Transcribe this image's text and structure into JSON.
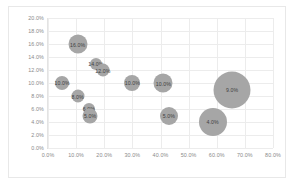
{
  "chart_data": {
    "type": "scatter",
    "title": "",
    "xlabel": "",
    "ylabel": "",
    "xlim": [
      0,
      80
    ],
    "ylim": [
      0,
      20
    ],
    "grid": true,
    "legend": false,
    "legend_position": "none",
    "xticks": [
      "0.0%",
      "10.0%",
      "20.0%",
      "30.0%",
      "40.0%",
      "50.0%",
      "60.0%",
      "70.0%",
      "80.0%"
    ],
    "xtick_values": [
      0,
      10,
      20,
      30,
      40,
      50,
      60,
      70,
      80
    ],
    "yticks": [
      "0.0%",
      "2.0%",
      "4.0%",
      "6.0%",
      "8.0%",
      "10.0%",
      "12.0%",
      "14.0%",
      "16.0%",
      "18.0%",
      "20.0%"
    ],
    "ytick_values": [
      0,
      2,
      4,
      6,
      8,
      10,
      12,
      14,
      16,
      18,
      20
    ],
    "bubble_color": "#a6a6a6",
    "points": [
      {
        "label": "16.0%",
        "x": 10.5,
        "y": 16.0,
        "size": 9.5,
        "label_pos": "center"
      },
      {
        "label": "14.0%",
        "x": 17.0,
        "y": 13.0,
        "size": 6.0,
        "label_pos": "center"
      },
      {
        "label": "12.0%",
        "x": 19.5,
        "y": 12.0,
        "size": 6.5,
        "label_pos": "center"
      },
      {
        "label": "10.0%",
        "x": 5.0,
        "y": 10.0,
        "size": 7.0,
        "label_pos": "center"
      },
      {
        "label": "8.0%",
        "x": 10.5,
        "y": 8.0,
        "size": 6.5,
        "label_pos": "center"
      },
      {
        "label": "6.0%",
        "x": 14.5,
        "y": 6.0,
        "size": 6.0,
        "label_pos": "center"
      },
      {
        "label": "5.0%",
        "x": 15.0,
        "y": 5.0,
        "size": 7.5,
        "label_pos": "center"
      },
      {
        "label": "10.0%",
        "x": 30.0,
        "y": 10.0,
        "size": 8.0,
        "label_pos": "center"
      },
      {
        "label": "10.0%",
        "x": 41.0,
        "y": 10.0,
        "size": 9.5,
        "label_pos": "center"
      },
      {
        "label": "5.0%",
        "x": 43.0,
        "y": 5.0,
        "size": 9.0,
        "label_pos": "center"
      },
      {
        "label": "9.0%",
        "x": 65.5,
        "y": 9.0,
        "size": 18.5,
        "label_pos": "center"
      },
      {
        "label": "4.0%",
        "x": 58.5,
        "y": 4.0,
        "size": 14.0,
        "label_pos": "center"
      }
    ]
  }
}
